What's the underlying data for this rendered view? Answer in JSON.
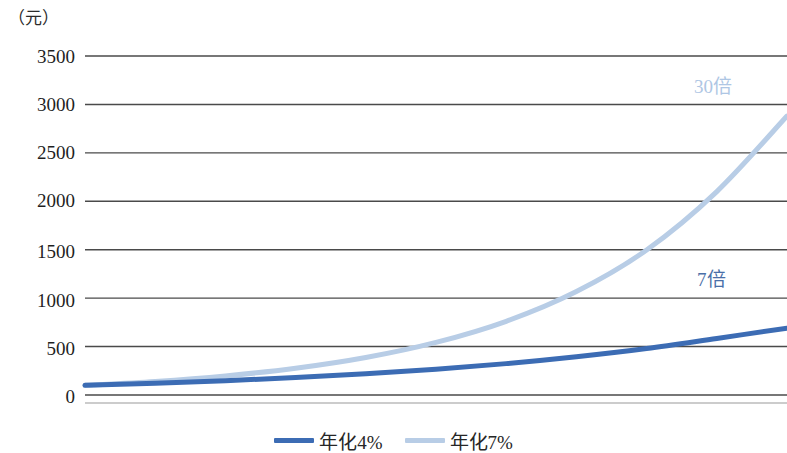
{
  "chart_data": {
    "type": "line",
    "title": "",
    "subtitle": "",
    "xlabel": "",
    "ylabel": "（元）",
    "unit_label": "（元）",
    "ylim": [
      0,
      3500
    ],
    "yticks": [
      0,
      500,
      1000,
      1500,
      2000,
      2500,
      3000,
      3500
    ],
    "ytick_labels": [
      "0",
      "500",
      "1000",
      "1500",
      "2000",
      "2500",
      "3000",
      "3500"
    ],
    "xlim": [
      0,
      50
    ],
    "xticks": [],
    "xtick_labels": [],
    "grid": true,
    "grid_axis": "y",
    "legend_position": "bottom",
    "series": [
      {
        "name": "年化4%",
        "color": "#3c6cb4",
        "rate": 0.04,
        "start_value": 100,
        "end_value": 690,
        "x": [
          0,
          5,
          10,
          15,
          20,
          25,
          30,
          35,
          40,
          45,
          50
        ],
        "values": [
          100,
          122,
          148,
          180,
          219,
          267,
          324,
          395,
          480,
          584,
          690
        ]
      },
      {
        "name": "年化7%",
        "color": "#b8cde6",
        "rate": 0.07,
        "start_value": 100,
        "end_value": 2880,
        "x": [
          0,
          5,
          10,
          15,
          20,
          25,
          30,
          35,
          40,
          45,
          50
        ],
        "values": [
          100,
          140,
          197,
          276,
          387,
          543,
          761,
          1068,
          1497,
          2100,
          2880
        ]
      }
    ],
    "annotations": [
      {
        "id": "annot-30x",
        "text": "30倍",
        "color": "#aec6e4",
        "series": "年化7%"
      },
      {
        "id": "annot-7x",
        "text": "7倍",
        "color": "#4a6fa8",
        "series": "年化4%"
      }
    ]
  },
  "legend": {
    "items": [
      {
        "label": "年化4%",
        "color": "#3c6cb4"
      },
      {
        "label": "年化7%",
        "color": "#b8cde6"
      }
    ]
  },
  "colors": {
    "series_dark_blue": "#3c6cb4",
    "series_light_blue": "#b8cde6",
    "gridline": "#4a4a4a",
    "text": "#1f1f1f",
    "background": "#ffffff"
  }
}
